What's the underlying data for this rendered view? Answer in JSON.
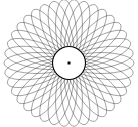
{
  "figure": {
    "type": "spirograph",
    "canvas": {
      "width": 138,
      "height": 127,
      "background_color": "#ffffff"
    },
    "pattern": {
      "center_x": 69,
      "center_y": 63,
      "petal_count": 38,
      "outer_radius_x": 65,
      "outer_radius_y": 62,
      "inner_hole_radius": 16.5,
      "ellipse_semi_major": 24.5,
      "ellipse_semi_minor": 10.5,
      "stroke_color": "#222222",
      "stroke_width": 0.45,
      "stroke_opacity": 0.92,
      "rotation_offset_deg": 0
    },
    "center_dot": {
      "shape": "square",
      "size": 3,
      "color": "#000000",
      "x": 69,
      "y": 63
    },
    "inner_circle": {
      "radius": 16.5,
      "fill": "#ffffff",
      "stroke_color": "#000000",
      "stroke_width": 1.1
    }
  }
}
